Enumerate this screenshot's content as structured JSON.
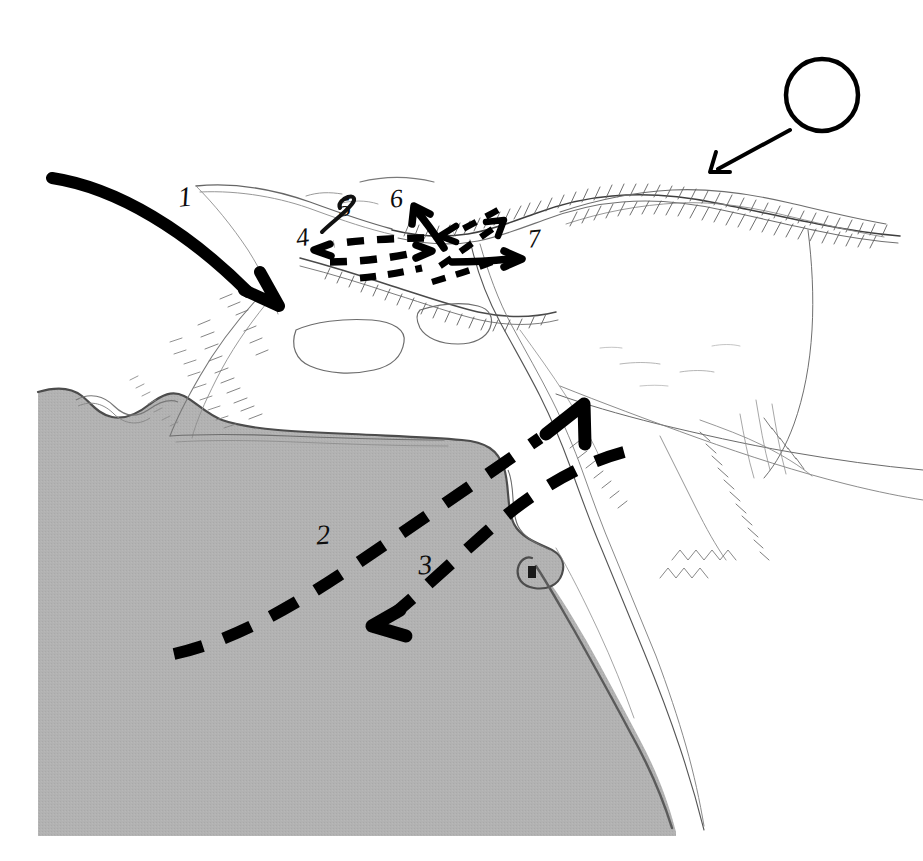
{
  "figure": {
    "kind": "hand-drawn-topographic-sketch",
    "width_px": 923,
    "height_px": 861,
    "background_color": "#ffffff",
    "ink_color": "#111111",
    "sea_fill_color": "#b0b0b0",
    "sea_edge_color": "#5d5d5d",
    "terrain_line_color": "#4a4a4a",
    "terrain_hachure_color": "#6b6b6b"
  },
  "annotations": {
    "numbered_labels": [
      {
        "id": "label-1",
        "text": "1",
        "x": 178,
        "y": 183,
        "font_size": 28,
        "rotate_deg": -6,
        "describes": "main solid curved arrow sweeping from upper-left down into the valley"
      },
      {
        "id": "label-2",
        "text": "2",
        "x": 316,
        "y": 521,
        "font_size": 28,
        "rotate_deg": -4,
        "describes": "long dashed arrow from lower-left across the sea to the inlet"
      },
      {
        "id": "label-3",
        "text": "3",
        "x": 418,
        "y": 551,
        "font_size": 28,
        "rotate_deg": -4,
        "describes": "dashed arrow from the inlet back out to the lower-left"
      },
      {
        "id": "label-4",
        "text": "4",
        "x": 296,
        "y": 225,
        "font_size": 26,
        "rotate_deg": -8,
        "describes": "westward dashed arrow along the upper valley floor"
      },
      {
        "id": "label-5",
        "text": "5",
        "x": 338,
        "y": 195,
        "font_size": 26,
        "rotate_deg": -8,
        "describes": "hooked stroke on the northern ridge spur"
      },
      {
        "id": "label-6",
        "text": "6",
        "x": 390,
        "y": 186,
        "font_size": 26,
        "rotate_deg": -6,
        "describes": "solid arrow pointing up-left into the saddle"
      },
      {
        "id": "label-7",
        "text": "7",
        "x": 528,
        "y": 226,
        "font_size": 26,
        "rotate_deg": -6,
        "describes": "solid arrow pointing east out of the pass"
      }
    ],
    "arrows": [
      {
        "id": "arrow-1-main",
        "style": "solid",
        "stroke_width": 11,
        "color": "#000000",
        "from": [
          52,
          178
        ],
        "to": [
          280,
          305
        ],
        "head": "down-right",
        "note": "thick bold curved approach arrow"
      },
      {
        "id": "arrow-2-dashed-inbound",
        "style": "dashed",
        "stroke_width": 11,
        "color": "#000000",
        "from": [
          172,
          655
        ],
        "to": [
          580,
          405
        ],
        "head": "up-right",
        "note": "long sweeping dashed arrow ending at the river mouth"
      },
      {
        "id": "arrow-3-dashed-outbound",
        "style": "dashed",
        "stroke_width": 11,
        "color": "#000000",
        "from": [
          620,
          450
        ],
        "to": [
          378,
          625
        ],
        "head": "down-left",
        "note": "dashed withdrawal arrow returning seaward"
      },
      {
        "id": "arrow-4-dashed-west",
        "style": "dashed",
        "stroke_width": 7,
        "color": "#000000",
        "from": [
          432,
          248
        ],
        "to": [
          316,
          250
        ],
        "head": "left"
      },
      {
        "id": "arrow-4b-dashed-east",
        "style": "dashed",
        "stroke_width": 7,
        "color": "#000000",
        "from": [
          330,
          262
        ],
        "to": [
          428,
          240
        ],
        "head": "right"
      },
      {
        "id": "arrow-6-solid-up",
        "style": "solid",
        "stroke_width": 7,
        "color": "#000000",
        "from": [
          444,
          247
        ],
        "to": [
          413,
          208
        ],
        "head": "up-left"
      },
      {
        "id": "arrow-x-dashed-up",
        "style": "dashed",
        "stroke_width": 6,
        "color": "#000000",
        "from": [
          440,
          263
        ],
        "to": [
          504,
          222
        ],
        "head": "up-right"
      },
      {
        "id": "arrow-x-dashed-down",
        "style": "dashed",
        "stroke_width": 6,
        "color": "#000000",
        "from": [
          500,
          221
        ],
        "to": [
          438,
          235
        ],
        "head": "down-left"
      },
      {
        "id": "arrow-7-solid-east",
        "style": "solid",
        "stroke_width": 7,
        "color": "#000000",
        "from": [
          452,
          262
        ],
        "to": [
          520,
          259
        ],
        "head": "right"
      },
      {
        "id": "arrow-sun-pointer",
        "style": "solid",
        "stroke_width": 4,
        "color": "#000000",
        "from": [
          788,
          132
        ],
        "to": [
          712,
          172
        ],
        "head": "down-left",
        "note": "thin leader line from the circle marker"
      }
    ],
    "markers": [
      {
        "id": "circle-marker",
        "shape": "circle-outline",
        "cx": 822,
        "cy": 95,
        "r": 36,
        "stroke_width": 4,
        "color": "#000000",
        "note": "open circle symbol at upper right"
      }
    ]
  },
  "map_features": {
    "sea": {
      "name": "sea",
      "fill": "#b0b0b0",
      "region": "lower-left, reaching the bottom edge"
    },
    "river": {
      "name": "river-valley",
      "note": "thin double-line watercourse running from the upper pass down to the bottom right"
    },
    "ridges": [
      {
        "name": "north-ridge",
        "hachured": true
      },
      {
        "name": "east-ridge",
        "hachured": true
      },
      {
        "name": "south-headland",
        "hachured": true
      }
    ],
    "fields": [
      {
        "name": "field-polygon-left"
      },
      {
        "name": "field-polygon-right"
      }
    ]
  }
}
